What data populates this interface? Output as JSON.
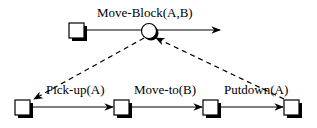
{
  "diagram": {
    "type": "hierarchical-task-decomposition",
    "top_task": {
      "label": "Move-Block(A,B)"
    },
    "subtasks": [
      {
        "label": "Pick-up(A)"
      },
      {
        "label": "Move-to(B)"
      },
      {
        "label": "Putdown(A)"
      }
    ],
    "edges": [
      {
        "from": "start-state",
        "to": "Move-Block(A,B)",
        "style": "solid"
      },
      {
        "from": "Move-Block(A,B)",
        "to": "end",
        "style": "solid-arrow"
      },
      {
        "from": "Move-Block(A,B)",
        "to": "state-1",
        "style": "dashed-arrow"
      },
      {
        "from": "state-1",
        "to": "state-2",
        "label": "Pick-up(A)",
        "style": "solid-arrow"
      },
      {
        "from": "state-2",
        "to": "state-3",
        "label": "Move-to(B)",
        "style": "solid-arrow"
      },
      {
        "from": "state-3",
        "to": "state-4",
        "label": "Putdown(A)",
        "style": "solid-arrow"
      },
      {
        "from": "state-4",
        "to": "Move-Block(A,B)",
        "style": "dashed-arrow"
      }
    ],
    "colors": {
      "stroke": "#000000",
      "background": "#ffffff"
    }
  }
}
